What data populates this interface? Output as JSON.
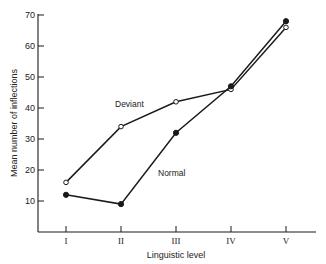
{
  "chart_data": {
    "type": "line",
    "title": "",
    "xlabel": "Linguistic level",
    "ylabel": "Mean number of inflections",
    "categories": [
      "I",
      "II",
      "III",
      "IV",
      "V"
    ],
    "ylim": [
      0,
      70
    ],
    "yticks": [
      10,
      20,
      30,
      40,
      50,
      60,
      70
    ],
    "grid": false,
    "legend": "inline labels",
    "series": [
      {
        "name": "Deviant",
        "marker": "open-circle",
        "values": [
          16,
          34,
          42,
          46,
          66
        ]
      },
      {
        "name": "Normal",
        "marker": "filled-circle",
        "values": [
          12,
          9,
          32,
          47,
          68
        ]
      }
    ],
    "annotations": [
      {
        "text": "Deviant",
        "x": 115,
        "y": 107
      },
      {
        "text": "Normal",
        "x": 158,
        "y": 176
      }
    ]
  },
  "colors": {
    "line": "#1a1a1a",
    "axis": "#1a1a1a",
    "background": "#ffffff"
  },
  "layout": {
    "x_axis_y": 232,
    "y_axis_x": 38,
    "x_axis_end": 316,
    "y_axis_top": 14,
    "px_per_unit": 3.1,
    "category_x": [
      66,
      121,
      176,
      231,
      286
    ]
  }
}
